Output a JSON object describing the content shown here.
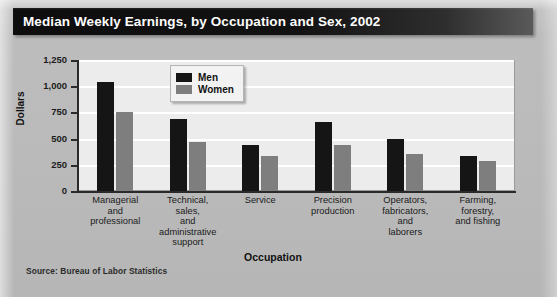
{
  "title": "Median Weekly Earnings, by Occupation and Sex, 2002",
  "source_note": "Source: Bureau of Labor Statistics",
  "legend": {
    "men_label": "Men",
    "women_label": "Women"
  },
  "axes": {
    "y_title": "Dollars",
    "x_title": "Occupation",
    "y_ticks": [
      "1,250",
      "1,000",
      "750",
      "500",
      "250",
      "0"
    ]
  },
  "colors": {
    "men": "#151515",
    "women": "#7e7e7e",
    "plot_background": "#ececec",
    "gridline": "#ffffff",
    "title_bar": "#0d0d0d",
    "page_background": "#bdbdbd"
  },
  "chart_data": {
    "type": "bar",
    "title": "Median Weekly Earnings, by Occupation and Sex, 2002",
    "xlabel": "Occupation",
    "ylabel": "Dollars",
    "ylim": [
      0,
      1250
    ],
    "ytick_values": [
      0,
      250,
      500,
      750,
      1000,
      1250
    ],
    "grid": true,
    "legend_position": "upper center",
    "categories": [
      "Managerial and professional",
      "Technical, sales, and administrative support",
      "Service",
      "Precision production",
      "Operators, fabricators, and laborers",
      "Farming, forestry, and fishing"
    ],
    "category_lines": [
      [
        "Managerial",
        "and",
        "professional"
      ],
      [
        "Technical,",
        "sales,",
        "and",
        "administrative",
        "support"
      ],
      [
        "Service"
      ],
      [
        "Precision",
        "production"
      ],
      [
        "Operators,",
        "fabricators,",
        "and",
        "laborers"
      ],
      [
        "Farming,",
        "forestry,",
        "and fishing"
      ]
    ],
    "series": [
      {
        "name": "Men",
        "values": [
          1040,
          690,
          440,
          660,
          500,
          330
        ]
      },
      {
        "name": "Women",
        "values": [
          755,
          470,
          330,
          440,
          350,
          290
        ]
      }
    ]
  }
}
